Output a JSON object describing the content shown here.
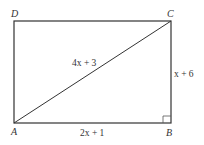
{
  "diagram": {
    "type": "rectangle-with-diagonal",
    "vertices": {
      "A": {
        "label": "A"
      },
      "B": {
        "label": "B"
      },
      "C": {
        "label": "C"
      },
      "D": {
        "label": "D"
      }
    },
    "measures": {
      "diagonal_AC": "4x + 3",
      "side_AB": "2x + 1",
      "side_BC": "x + 6"
    },
    "right_angle_at": "B",
    "colors": {
      "stroke": "#333333",
      "background": "#ffffff"
    }
  }
}
